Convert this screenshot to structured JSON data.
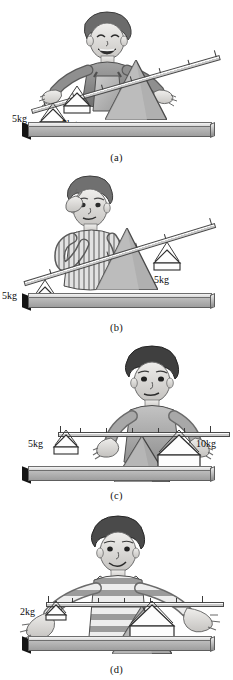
{
  "figure": {
    "panel_count": 4,
    "colors": {
      "ink": "#1a1a1a",
      "beam_light": "#fbfbfb",
      "beam_dark": "#c9c9c9",
      "plank_top": "#e6e6e6",
      "plank_face": "#a8a8a8",
      "fulcrum_fill": "#b4b4b4",
      "endcap": "#141414",
      "background": "#ffffff"
    }
  },
  "panels": [
    {
      "id": "a",
      "caption": "(a)",
      "state": "unbalanced-tilted-left-down",
      "description": "Boy with arms spread; beam tilts up to the right. Both masses equal but placed at unequal distances from the fulcrum.",
      "beam_angle_deg": -16,
      "tick_count": 7,
      "fulcrum": {
        "position": "right-of-centre"
      },
      "weights": [
        {
          "side": "left",
          "label": "5kg",
          "value": 5,
          "unit": "kg",
          "label_side": "left"
        },
        {
          "side": "middle",
          "label": "5kg",
          "value": 5,
          "unit": "kg",
          "label_side": "below"
        }
      ],
      "boy": {
        "expression": "laughing",
        "pose": "arms-spread",
        "clothing": "dungarees"
      }
    },
    {
      "id": "b",
      "caption": "(b)",
      "state": "unbalanced-tilted-left-down",
      "description": "Boy scratching head puzzled; beam tilts up to the right with equal 5kg masses at unequal distances.",
      "beam_angle_deg": -17,
      "tick_count": 6,
      "fulcrum": {
        "position": "centre-right"
      },
      "weights": [
        {
          "side": "left",
          "label": "5kg",
          "value": 5,
          "unit": "kg",
          "label_side": "left"
        },
        {
          "side": "right",
          "label": "5kg",
          "value": 5,
          "unit": "kg",
          "label_side": "below"
        }
      ],
      "boy": {
        "expression": "puzzled",
        "pose": "hand-to-head",
        "clothing": "striped-shirt"
      }
    },
    {
      "id": "c",
      "caption": "(c)",
      "state": "balanced-level",
      "description": "Boy with open palms; beam horizontal and balanced: 5kg far from fulcrum balances 10kg near the fulcrum.",
      "beam_angle_deg": 0,
      "tick_count": 7,
      "fulcrum": {
        "position": "centre"
      },
      "weights": [
        {
          "side": "left",
          "label": "5kg",
          "value": 5,
          "unit": "kg",
          "label_side": "left"
        },
        {
          "side": "right",
          "label": "10kg",
          "value": 10,
          "unit": "kg",
          "label_side": "right"
        }
      ],
      "boy": {
        "expression": "serious",
        "pose": "palms-up",
        "clothing": "collared-sweater"
      }
    },
    {
      "id": "d",
      "caption": "(d)",
      "state": "balanced-level",
      "description": "Smiling boy with arms stretched wide; beam horizontal and balanced: 2kg far from fulcrum balances 8kg near it.",
      "beam_angle_deg": 0,
      "tick_count": 7,
      "fulcrum": {
        "position": "centre-right"
      },
      "weights": [
        {
          "side": "left",
          "label": "2kg",
          "value": 2,
          "unit": "kg",
          "label_side": "left"
        },
        {
          "side": "right",
          "label": "8kg",
          "value": 8,
          "unit": "kg",
          "label_side": "below-right"
        }
      ],
      "boy": {
        "expression": "smiling",
        "pose": "arms-outstretched",
        "clothing": "striped-polo"
      }
    }
  ]
}
